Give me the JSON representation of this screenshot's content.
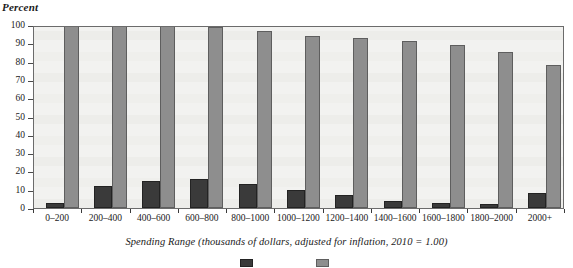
{
  "chart_data": {
    "type": "bar",
    "title": "",
    "ylabel": "Percent",
    "xlabel": "Spending Range (thousands of dollars, adjusted for inflation, 2010 = 1.00)",
    "ylim": [
      0,
      100
    ],
    "yticks": [
      0,
      10,
      20,
      30,
      40,
      50,
      60,
      70,
      80,
      90,
      100
    ],
    "grid": false,
    "legend_position": "bottom",
    "categories": [
      "0–200",
      "200–400",
      "400–600",
      "600–800",
      "800–1000",
      "1000–1200",
      "1200–1400",
      "1400–1600",
      "1600–1800",
      "1800–2000",
      "2000+"
    ],
    "series": [
      {
        "name": "Percent of Races",
        "color": "#3a3a3a",
        "values": [
          3,
          12,
          15,
          16,
          13,
          10,
          7,
          4,
          3,
          2,
          8
        ]
      },
      {
        "name": "Cumulative Percent",
        "color": "#8e8e8e",
        "values": [
          100,
          100,
          100,
          99,
          97,
          94,
          93,
          91,
          89,
          85,
          78
        ]
      }
    ]
  },
  "axes": {
    "y_title": "Percent",
    "y_tick_labels": [
      "100",
      "90",
      "80",
      "70",
      "60",
      "50",
      "40",
      "30",
      "20",
      "10",
      "0"
    ],
    "x_caption": "Spending Range (thousands of dollars, adjusted for inflation, 2010 = 1.00)"
  },
  "legend": {
    "items": [
      {
        "label": "",
        "color": "#3a3a3a"
      },
      {
        "label": "",
        "color": "#8e8e8e"
      }
    ]
  }
}
